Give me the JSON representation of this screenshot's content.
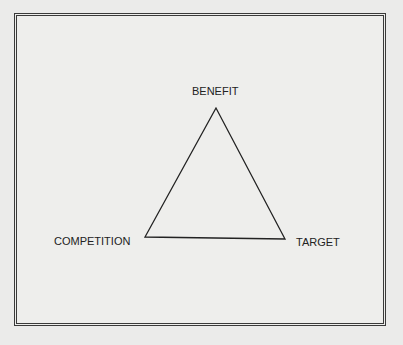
{
  "diagram": {
    "type": "triangle",
    "nodes": [
      {
        "id": "benefit",
        "label": "BENEFIT",
        "position": "top"
      },
      {
        "id": "competition",
        "label": "COMPETITION",
        "position": "bottom-left"
      },
      {
        "id": "target",
        "label": "TARGET",
        "position": "bottom-right"
      }
    ],
    "edges": [
      [
        "benefit",
        "competition"
      ],
      [
        "competition",
        "target"
      ],
      [
        "target",
        "benefit"
      ]
    ],
    "colors": {
      "background": "#ebebea",
      "line": "#222222",
      "frame": "#3a3a3a"
    }
  }
}
